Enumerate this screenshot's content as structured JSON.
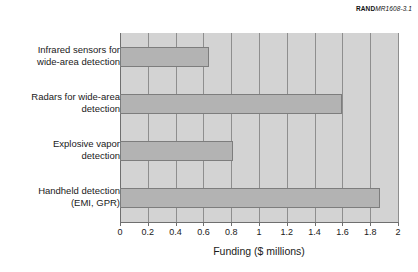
{
  "figure": {
    "brand": "RAND",
    "document_id": "MR1608-3.1"
  },
  "chart_data": {
    "type": "bar",
    "orientation": "horizontal",
    "title": "",
    "xlabel": "Funding ($ millions)",
    "ylabel": "",
    "xlim": [
      0,
      2
    ],
    "xticks": [
      0,
      0.2,
      0.4,
      0.6,
      0.8,
      1,
      1.2,
      1.4,
      1.6,
      1.8,
      2
    ],
    "xtick_labels": [
      "0",
      "0.2",
      "0.4",
      "0.6",
      "0.8",
      "1",
      "1.2",
      "1.4",
      "1.6",
      "1.8",
      "2"
    ],
    "grid": "vertical",
    "legend": "none",
    "plot_background": "#d3d3d3",
    "bar_fill": "#b3b3b3",
    "bar_edge": "#7d7d7d",
    "categories": [
      "Infrared sensors for wide-area detection",
      "Radars for wide-area detection",
      "Explosive vapor detection",
      "Handheld detection (EMI, GPR)"
    ],
    "category_lines": [
      [
        "Infrared sensors for",
        "wide-area detection"
      ],
      [
        "Radars for wide-area",
        "detection"
      ],
      [
        "Explosive vapor",
        "detection"
      ],
      [
        "Handheld detection",
        "(EMI, GPR)"
      ]
    ],
    "values": [
      0.64,
      1.6,
      0.81,
      1.87
    ]
  }
}
